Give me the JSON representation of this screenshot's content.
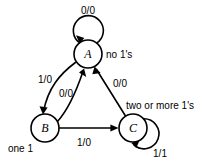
{
  "diagram": {
    "type": "finite-state-machine",
    "title": "",
    "background_color": "#ffffff",
    "line_color": "#000000",
    "states": [
      {
        "id": "A",
        "label": "A",
        "note": "no 1's",
        "cx": 88,
        "cy": 54,
        "r": 14
      },
      {
        "id": "B",
        "label": "B",
        "note": "one 1",
        "cx": 45,
        "cy": 128,
        "r": 14
      },
      {
        "id": "C",
        "label": "C",
        "note": "two or more 1's",
        "cx": 133,
        "cy": 128,
        "r": 14
      }
    ],
    "transitions": [
      {
        "from": "A",
        "to": "A",
        "label": "0/0",
        "kind": "self-loop"
      },
      {
        "from": "A",
        "to": "B",
        "label": "1/0",
        "kind": "curve"
      },
      {
        "from": "B",
        "to": "A",
        "label": "0/0",
        "kind": "curve"
      },
      {
        "from": "B",
        "to": "C",
        "label": "1/0",
        "kind": "straight"
      },
      {
        "from": "C",
        "to": "A",
        "label": "0/0",
        "kind": "straight"
      },
      {
        "from": "C",
        "to": "C",
        "label": "1/1",
        "kind": "self-loop"
      }
    ],
    "labels": {
      "a_self_loop": "0/0",
      "a_to_b": "1/0",
      "b_to_a": "0/0",
      "b_to_c": "1/0",
      "c_to_a": "0/0",
      "c_self_loop": "1/1",
      "state_a": "A",
      "state_b": "B",
      "state_c": "C",
      "note_a": "no 1's",
      "note_b": "one 1",
      "note_c": "two or more 1's"
    }
  }
}
